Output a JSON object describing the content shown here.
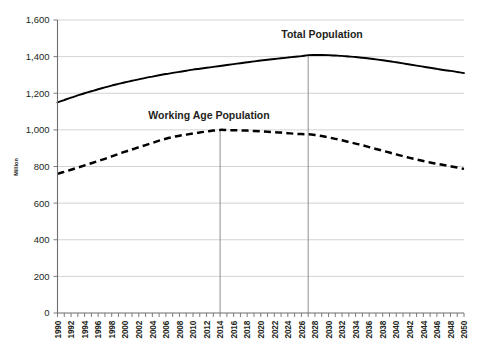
{
  "chart_data": {
    "type": "line",
    "title": "",
    "xlabel": "",
    "ylabel": "Million",
    "ylim": [
      0,
      1600
    ],
    "yticks": [
      "0",
      "200",
      "400",
      "600",
      "800",
      "1,000",
      "1,200",
      "1,400",
      "1,600"
    ],
    "grid": true,
    "legend_position": "inline-annotation",
    "x": [
      1990,
      1991,
      1992,
      1993,
      1994,
      1995,
      1996,
      1997,
      1998,
      1999,
      2000,
      2001,
      2002,
      2003,
      2004,
      2005,
      2006,
      2007,
      2008,
      2009,
      2010,
      2011,
      2012,
      2013,
      2014,
      2015,
      2016,
      2017,
      2018,
      2019,
      2020,
      2021,
      2022,
      2023,
      2024,
      2025,
      2026,
      2027,
      2028,
      2029,
      2030,
      2031,
      2032,
      2033,
      2034,
      2035,
      2036,
      2037,
      2038,
      2039,
      2040,
      2041,
      2042,
      2043,
      2044,
      2045,
      2046,
      2047,
      2048,
      2049,
      2050
    ],
    "xticks": [
      "1990",
      "1992",
      "1994",
      "1996",
      "1998",
      "2000",
      "2002",
      "2004",
      "2006",
      "2008",
      "2010",
      "2012",
      "2014",
      "2016",
      "2018",
      "2020",
      "2022",
      "2024",
      "2026",
      "2028",
      "2030",
      "2032",
      "2034",
      "2036",
      "2038",
      "2040",
      "2042",
      "2044",
      "2046",
      "2048",
      "2050"
    ],
    "series": [
      {
        "name": "Total Population",
        "style": "solid",
        "annotation": "Total Population",
        "values": [
          1150,
          1163,
          1176,
          1188,
          1200,
          1211,
          1222,
          1232,
          1242,
          1251,
          1260,
          1268,
          1276,
          1284,
          1291,
          1298,
          1305,
          1311,
          1317,
          1323,
          1329,
          1334,
          1339,
          1344,
          1349,
          1354,
          1359,
          1364,
          1369,
          1374,
          1379,
          1383,
          1387,
          1391,
          1395,
          1399,
          1403,
          1408,
          1409,
          1409,
          1408,
          1406,
          1404,
          1401,
          1398,
          1394,
          1390,
          1385,
          1380,
          1375,
          1369,
          1363,
          1357,
          1351,
          1345,
          1339,
          1333,
          1327,
          1322,
          1316,
          1310
        ]
      },
      {
        "name": "Working Age Population",
        "style": "dashed",
        "annotation": "Working Age Population",
        "values": [
          760,
          771,
          782,
          794,
          806,
          818,
          830,
          842,
          855,
          868,
          881,
          893,
          905,
          917,
          929,
          941,
          952,
          961,
          968,
          974,
          980,
          986,
          991,
          996,
          1000,
          999,
          998,
          997,
          996,
          994,
          992,
          990,
          988,
          985,
          982,
          979,
          977,
          976,
          972,
          966,
          959,
          951,
          943,
          934,
          925,
          916,
          906,
          896,
          886,
          876,
          866,
          856,
          847,
          838,
          830,
          822,
          815,
          808,
          801,
          794,
          787
        ]
      }
    ],
    "markers": [
      {
        "name": "working-age-peak",
        "year": 2014,
        "value": 1000
      },
      {
        "name": "total-population-peak",
        "year": 2027,
        "value": 1408
      }
    ]
  }
}
